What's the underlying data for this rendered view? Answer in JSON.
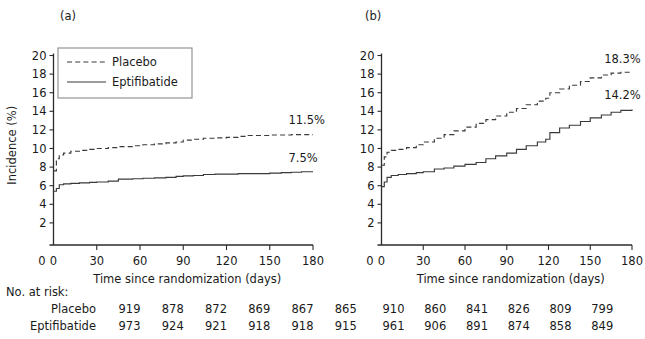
{
  "figure": {
    "panels": [
      {
        "key": "a",
        "label": "(a)",
        "xlabel": "Time since randomization (days)",
        "ylabel": "Incidence (%)"
      },
      {
        "key": "b",
        "label": "(b)",
        "xlabel": "Time since randomization (days)",
        "ylabel": ""
      }
    ],
    "legend": {
      "items": [
        {
          "label": "Placebo",
          "style": "dashed"
        },
        {
          "label": "Eptifibatide",
          "style": "solid"
        }
      ]
    },
    "risk_table": {
      "title": "No. at risk:",
      "row_labels": [
        "Placebo",
        "Eptifibatide"
      ],
      "panel_a": {
        "placebo": [
          919,
          878,
          872,
          869,
          867,
          865
        ],
        "eptifibatide": [
          973,
          924,
          921,
          918,
          918,
          915
        ]
      },
      "panel_b": {
        "placebo": [
          910,
          860,
          841,
          826,
          809,
          799
        ],
        "eptifibatide": [
          961,
          906,
          891,
          874,
          858,
          849
        ]
      }
    },
    "colors": {
      "line": "#3a3a3a",
      "axis": "#2b2b2b",
      "text": "#1a1a1a",
      "legend_border": "#8a8a8a"
    }
  },
  "chart_data": [
    {
      "type": "line",
      "panel": "a",
      "title": "(a)",
      "xlabel": "Time since randomization (days)",
      "ylabel": "Incidence (%)",
      "xlim": [
        0,
        180
      ],
      "ylim": [
        0,
        20
      ],
      "xticks": [
        0,
        30,
        60,
        90,
        120,
        150,
        180
      ],
      "yticks": [
        0,
        2,
        4,
        6,
        8,
        10,
        12,
        14,
        16,
        18,
        20
      ],
      "grid": false,
      "legend_position": "upper-left",
      "annotations": [
        {
          "text": "11.5%",
          "x": 163,
          "y": 12.6,
          "series": "Placebo"
        },
        {
          "text": "7.5%",
          "x": 163,
          "y": 8.6,
          "series": "Eptifibatide"
        }
      ],
      "series": [
        {
          "name": "Placebo",
          "style": "dashed",
          "x": [
            0,
            2,
            4,
            7,
            12,
            18,
            25,
            30,
            38,
            45,
            55,
            62,
            70,
            78,
            85,
            90,
            97,
            104,
            112,
            120,
            128,
            135,
            143,
            150,
            158,
            165,
            172,
            180
          ],
          "values": [
            7.6,
            8.9,
            9.3,
            9.5,
            9.7,
            9.8,
            9.9,
            10.0,
            10.1,
            10.2,
            10.3,
            10.4,
            10.5,
            10.6,
            10.7,
            10.9,
            11.0,
            11.1,
            11.15,
            11.2,
            11.3,
            11.4,
            11.4,
            11.45,
            11.45,
            11.5,
            11.5,
            11.5
          ]
        },
        {
          "name": "Eptifibatide",
          "style": "solid",
          "x": [
            0,
            2,
            4,
            7,
            12,
            18,
            25,
            30,
            38,
            45,
            55,
            62,
            70,
            78,
            85,
            90,
            97,
            104,
            112,
            120,
            128,
            135,
            143,
            150,
            158,
            165,
            172,
            180
          ],
          "values": [
            5.4,
            5.7,
            6.1,
            6.2,
            6.25,
            6.3,
            6.35,
            6.4,
            6.5,
            6.7,
            6.75,
            6.8,
            6.85,
            6.9,
            7.0,
            7.05,
            7.1,
            7.2,
            7.25,
            7.25,
            7.3,
            7.3,
            7.3,
            7.35,
            7.4,
            7.45,
            7.5,
            7.5
          ]
        }
      ]
    },
    {
      "type": "line",
      "panel": "b",
      "title": "(b)",
      "xlabel": "Time since randomization (days)",
      "ylabel": "",
      "xlim": [
        0,
        180
      ],
      "ylim": [
        0,
        20
      ],
      "xticks": [
        0,
        30,
        60,
        90,
        120,
        150,
        180
      ],
      "yticks": [
        0,
        2,
        4,
        6,
        8,
        10,
        12,
        14,
        16,
        18,
        20
      ],
      "grid": false,
      "legend_position": "none",
      "annotations": [
        {
          "text": "18.3%",
          "x": 160,
          "y": 19.2,
          "series": "Placebo"
        },
        {
          "text": "14.2%",
          "x": 160,
          "y": 15.3,
          "series": "Eptifibatide"
        }
      ],
      "series": [
        {
          "name": "Placebo",
          "style": "dashed",
          "x": [
            0,
            2,
            4,
            7,
            12,
            18,
            25,
            30,
            38,
            45,
            52,
            60,
            68,
            75,
            82,
            90,
            97,
            104,
            112,
            118,
            121,
            128,
            135,
            143,
            150,
            158,
            165,
            172,
            180
          ],
          "values": [
            8.2,
            9.1,
            9.6,
            9.8,
            9.9,
            10.1,
            10.4,
            10.7,
            11.1,
            11.5,
            11.9,
            12.3,
            12.7,
            13.1,
            13.5,
            13.9,
            14.3,
            14.7,
            15.1,
            15.4,
            16.0,
            16.4,
            16.8,
            17.2,
            17.6,
            17.9,
            18.1,
            18.2,
            18.3
          ]
        },
        {
          "name": "Eptifibatide",
          "style": "solid",
          "x": [
            0,
            2,
            4,
            7,
            12,
            18,
            25,
            30,
            38,
            45,
            52,
            60,
            68,
            75,
            82,
            90,
            97,
            104,
            112,
            118,
            121,
            128,
            135,
            143,
            150,
            158,
            165,
            172,
            180
          ],
          "values": [
            5.9,
            6.4,
            6.9,
            7.1,
            7.2,
            7.3,
            7.4,
            7.5,
            7.8,
            7.9,
            8.1,
            8.3,
            8.5,
            8.9,
            9.2,
            9.5,
            9.9,
            10.3,
            10.7,
            11.0,
            11.7,
            12.2,
            12.5,
            12.9,
            13.3,
            13.6,
            13.9,
            14.1,
            14.2
          ]
        }
      ]
    }
  ]
}
